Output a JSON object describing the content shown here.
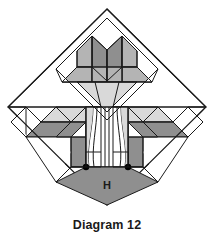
{
  "figure": {
    "caption": "Diagram 12",
    "center_label": "H",
    "title_hidden": "Quilt block piecing diagram"
  },
  "palette": {
    "background": "#ffffff",
    "outline": "#1a1a1a",
    "white_patch": "#ffffff",
    "light_gray": "#d9d9d9",
    "medium_gray": "#b4b4b4",
    "dark_gray": "#8f8f8f",
    "node_dot": "#000000",
    "caption_color": "#1a1a1a"
  },
  "geometry": {
    "canvas_width": 214,
    "canvas_height": 241,
    "diamond_center_x": 107,
    "diamond_center_y": 107,
    "diamond_half_width": 100,
    "diamond_half_height": 98
  },
  "parts": {
    "outer_diamond": "block-outline-diamond",
    "top_chevrons": [
      "chevron-top-left",
      "chevron-top-right"
    ],
    "top_bar": "top-horizontal-bar",
    "top_point": "top-center-triangle",
    "left_arm": "left-feather-arm",
    "right_arm": "right-feather-arm",
    "center_column": "center-appliqué-column",
    "bottom_diamond": "bottom-half-diamond-H",
    "corner_squares": [
      "corner-square-left",
      "corner-square-right"
    ],
    "node_dots": [
      "node-dot-left",
      "node-dot-right"
    ]
  }
}
